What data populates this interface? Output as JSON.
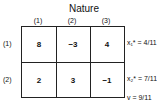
{
  "title": "Nature",
  "columns": [
    "(1)",
    "(2)",
    "(3)"
  ],
  "rows": [
    {
      "label": "(1)",
      "values": [
        "8",
        "−3",
        "4"
      ],
      "annotation": "x₁* = 4/11"
    },
    {
      "label": "(2)",
      "values": [
        "2",
        "3",
        "−1"
      ],
      "annotation": "x₂* = 7/11"
    }
  ],
  "value_annotation": "v = 9/11"
}
